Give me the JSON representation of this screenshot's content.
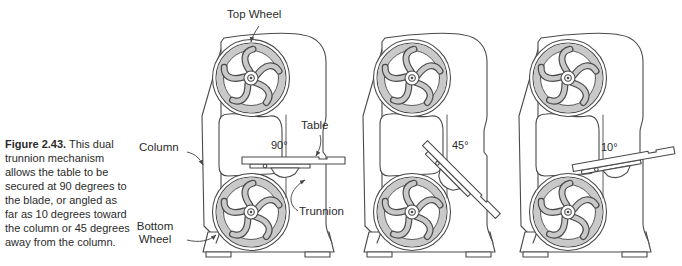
{
  "caption": {
    "figure_label": "Figure 2.43.",
    "lines": [
      "This dual",
      "trunnion mechanism",
      "allows the table to be",
      "secured at 90 degrees to",
      "the blade, or angled as",
      "far as 10 degrees toward",
      "the column or 45 degrees",
      "away from the column."
    ]
  },
  "labels": {
    "top_wheel": "Top Wheel",
    "column": "Column",
    "bottom_wheel_line1": "Bottom",
    "bottom_wheel_line2": "Wheel",
    "table": "Table",
    "trunnion": "Trunnion"
  },
  "angles": {
    "machine1": "90°",
    "machine2": "45°",
    "machine3": "10°"
  },
  "colors": {
    "line": "#4a4a4a",
    "wheel_gray": "#c9c9c9",
    "text": "#2b2b2b",
    "background": "#ffffff"
  }
}
